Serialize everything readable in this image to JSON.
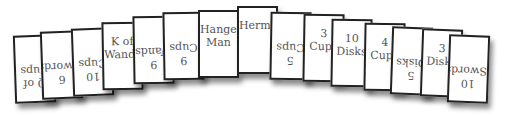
{
  "spread": {
    "cards": [
      {
        "label": "Q of\nCups",
        "reversed": true,
        "x": 14,
        "y": 35,
        "rot": -2
      },
      {
        "label": "6\nSwords",
        "reversed": true,
        "x": 41,
        "y": 31,
        "rot": -2
      },
      {
        "label": "10\nCups",
        "reversed": true,
        "x": 72,
        "y": 28,
        "rot": -2
      },
      {
        "label": "K of\nWands",
        "reversed": false,
        "x": 102,
        "y": 22,
        "rot": -1
      },
      {
        "label": "9\nWands",
        "reversed": true,
        "x": 133,
        "y": 16,
        "rot": -1
      },
      {
        "label": "9\nCups",
        "reversed": true,
        "x": 163,
        "y": 12,
        "rot": -1
      },
      {
        "label": "Hanged\nMan",
        "reversed": false,
        "x": 198,
        "y": 10,
        "rot": 0
      },
      {
        "label": "Hermit",
        "reversed": false,
        "x": 237,
        "y": 6,
        "rot": 0
      },
      {
        "label": "5\nCups",
        "reversed": true,
        "x": 270,
        "y": 12,
        "rot": 1
      },
      {
        "label": "3\nCups",
        "reversed": false,
        "x": 303,
        "y": 14,
        "rot": 1
      },
      {
        "label": "10\nDisks",
        "reversed": false,
        "x": 331,
        "y": 19,
        "rot": 1
      },
      {
        "label": "4\nCups",
        "reversed": false,
        "x": 364,
        "y": 23,
        "rot": 1
      },
      {
        "label": "5\nDisks",
        "reversed": true,
        "x": 391,
        "y": 27,
        "rot": 2
      },
      {
        "label": "3\nDisks",
        "reversed": false,
        "x": 421,
        "y": 29,
        "rot": 2
      },
      {
        "label": "10\nSwords",
        "reversed": true,
        "x": 448,
        "y": 35,
        "rot": 2
      }
    ]
  }
}
